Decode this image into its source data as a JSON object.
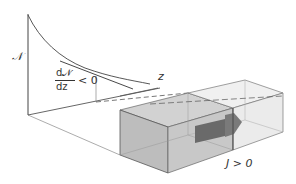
{
  "diagram": {
    "y_axis_label": "𝒩",
    "x_axis_label": "z",
    "gradient_label": {
      "numerator": "d𝒩",
      "denominator": "dz",
      "relation": "< 0"
    },
    "flux_label": "J > 0",
    "colors": {
      "line": "#555555",
      "curve": "#444444",
      "box_left_fill": "#c4c4c4",
      "box_right_fill": "#ececec",
      "arrow_fill": "#666666"
    }
  }
}
